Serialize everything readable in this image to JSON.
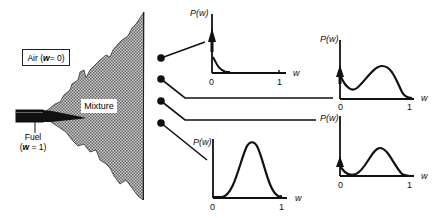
{
  "jet": {
    "air_label": "Air (w = 0)",
    "air_prefix": "Air (",
    "air_var": "w",
    "air_suffix": " = 0)",
    "mixture_label": "Mixture",
    "fuel_label": "Fuel",
    "fuel_value_prefix": "(",
    "fuel_var": "w",
    "fuel_value_suffix": " = 1)"
  },
  "probes": [
    {
      "id": 1,
      "target": "pdf-1"
    },
    {
      "id": 2,
      "target": "pdf-2"
    },
    {
      "id": 3,
      "target": "pdf-3"
    },
    {
      "id": 4,
      "target": "pdf-4"
    }
  ],
  "pdf_plots": [
    {
      "ylabel": "P(w)",
      "xlabel": "w",
      "tick0": "0",
      "tick1": "1",
      "shape": "delta at 0 with decaying tail"
    },
    {
      "ylabel": "P(w)",
      "xlabel": "w",
      "tick0": "0",
      "tick1": "1",
      "shape": "delta at 0 plus broad bump"
    },
    {
      "ylabel": "P(w)",
      "xlabel": "w",
      "tick0": "0",
      "tick1": "1",
      "shape": "small delta at 0 plus bump"
    },
    {
      "ylabel": "P(w)",
      "xlabel": "w",
      "tick0": "0",
      "tick1": "1",
      "shape": "Gaussian-like peak"
    }
  ],
  "colors": {
    "ink": "#111111",
    "mixture_fill": "#9a9a9a",
    "background": "#ffffff"
  }
}
